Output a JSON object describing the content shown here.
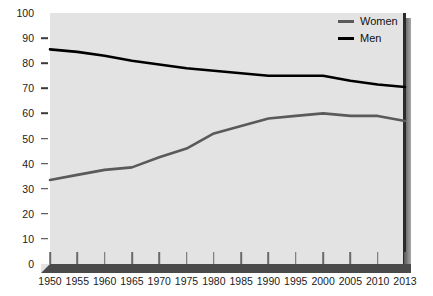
{
  "chart_data": {
    "type": "line",
    "title": "",
    "xlabel": "",
    "ylabel": "",
    "ylim": [
      0,
      100
    ],
    "ytick_step": 10,
    "grid": false,
    "legend_position": "top-right",
    "background": "#e3e3e3",
    "categories": [
      "1950",
      "1955",
      "1960",
      "1965",
      "1970",
      "1975",
      "1980",
      "1985",
      "1990",
      "1995",
      "2000",
      "2005",
      "2010",
      "2013"
    ],
    "yticks": [
      "0",
      "10",
      "20",
      "30",
      "40",
      "50",
      "60",
      "70",
      "80",
      "90",
      "100"
    ],
    "series": [
      {
        "name": "Women",
        "color": "#5a5a5a",
        "values": [
          33.5,
          35.5,
          37.5,
          38.5,
          42.5,
          46.0,
          52.0,
          55.0,
          58.0,
          59.0,
          60.0,
          59.0,
          59.0,
          57.0
        ]
      },
      {
        "name": "Men",
        "color": "#000000",
        "values": [
          85.5,
          84.5,
          83.0,
          81.0,
          79.5,
          78.0,
          77.0,
          76.0,
          75.0,
          75.0,
          75.0,
          73.0,
          71.5,
          70.5
        ]
      }
    ]
  },
  "legend": {
    "items": [
      {
        "label": "Women",
        "color": "#5a5a5a"
      },
      {
        "label": "Men",
        "color": "#000000"
      }
    ]
  }
}
